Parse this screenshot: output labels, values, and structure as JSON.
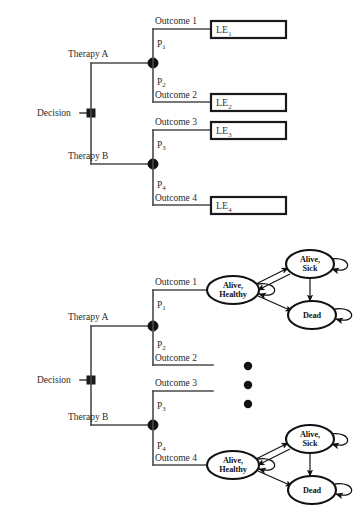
{
  "figure": {
    "background_color": "#ffffff",
    "line_color": "#4a4a4a",
    "node_color": "#111111"
  },
  "top_panel": {
    "root_label": "Decision",
    "branches": [
      {
        "therapy_label": "Therapy A",
        "outcomes": [
          {
            "prob_base": "P",
            "prob_sub": "1",
            "outcome_label": "Outcome 1",
            "payoff_base": "LE",
            "payoff_sub": "1"
          },
          {
            "prob_base": "P",
            "prob_sub": "2",
            "outcome_label": "Outcome 2",
            "payoff_base": "LE",
            "payoff_sub": "2"
          }
        ]
      },
      {
        "therapy_label": "Therapy B",
        "outcomes": [
          {
            "prob_base": "P",
            "prob_sub": "3",
            "outcome_label": "Outcome 3",
            "payoff_base": "LE",
            "payoff_sub": "3"
          },
          {
            "prob_base": "P",
            "prob_sub": "4",
            "outcome_label": "Outcome 4",
            "payoff_base": "LE",
            "payoff_sub": "4"
          }
        ]
      }
    ]
  },
  "bottom_panel": {
    "root_label": "Decision",
    "branches": [
      {
        "therapy_label": "Therapy A",
        "outcomes": [
          {
            "prob_base": "P",
            "prob_sub": "1",
            "outcome_label": "Outcome 1"
          },
          {
            "prob_base": "P",
            "prob_sub": "2",
            "outcome_label": "Outcome 2"
          }
        ]
      },
      {
        "therapy_label": "Therapy B",
        "outcomes": [
          {
            "prob_base": "P",
            "prob_sub": "3",
            "outcome_label": "Outcome 3"
          },
          {
            "prob_base": "P",
            "prob_sub": "4",
            "outcome_label": "Outcome 4"
          }
        ]
      }
    ],
    "vertical_ellipsis": "•••",
    "markov_models": [
      {
        "attached_to": "Outcome 1",
        "states": [
          {
            "id": "alive-healthy",
            "line1": "Alive,",
            "line2": "Healthy"
          },
          {
            "id": "alive-sick",
            "line1": "Alive,",
            "line2": "Sick"
          },
          {
            "id": "dead",
            "line1": "Dead",
            "line2": ""
          }
        ],
        "transitions": [
          {
            "from": "alive-healthy",
            "to": "alive-sick"
          },
          {
            "from": "alive-sick",
            "to": "alive-healthy"
          },
          {
            "from": "alive-healthy",
            "to": "dead"
          },
          {
            "from": "alive-sick",
            "to": "dead"
          },
          {
            "from": "alive-healthy",
            "to": "alive-healthy"
          },
          {
            "from": "alive-sick",
            "to": "alive-sick"
          },
          {
            "from": "dead",
            "to": "dead"
          }
        ]
      },
      {
        "attached_to": "Outcome 4",
        "states": [
          {
            "id": "alive-healthy",
            "line1": "Alive,",
            "line2": "Healthy"
          },
          {
            "id": "alive-sick",
            "line1": "Alive,",
            "line2": "Sick"
          },
          {
            "id": "dead",
            "line1": "Dead",
            "line2": ""
          }
        ],
        "transitions": [
          {
            "from": "alive-healthy",
            "to": "alive-sick"
          },
          {
            "from": "alive-sick",
            "to": "alive-healthy"
          },
          {
            "from": "alive-healthy",
            "to": "dead"
          },
          {
            "from": "alive-sick",
            "to": "dead"
          },
          {
            "from": "alive-healthy",
            "to": "alive-healthy"
          },
          {
            "from": "alive-sick",
            "to": "alive-sick"
          },
          {
            "from": "dead",
            "to": "dead"
          }
        ]
      }
    ]
  }
}
